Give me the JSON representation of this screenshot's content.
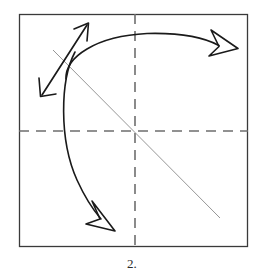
{
  "figure": {
    "kind": "origami-fold-step-diagram",
    "caption": "2.",
    "canvas": {
      "width": 264,
      "height": 279,
      "background": "#ffffff"
    },
    "colors": {
      "paper_border": "#3a3a3a",
      "crease_dashed": "#6e6e6e",
      "crease_thin": "#8a8a8a",
      "arrow_stroke": "#1a1a1a",
      "caption_text": "#2b2b2b"
    },
    "paper_square": {
      "label": "paper-outline",
      "x": 19,
      "y": 14,
      "width": 229,
      "height": 233,
      "stroke_width": 1.3
    },
    "creases": [
      {
        "name": "horizontal-crease",
        "style": "dashed",
        "x1": 19,
        "y1": 131,
        "x2": 248,
        "y2": 131,
        "dash": "10 7"
      },
      {
        "name": "vertical-crease",
        "style": "dashed",
        "x1": 135,
        "y1": 14,
        "x2": 135,
        "y2": 247,
        "dash": "10 7"
      },
      {
        "name": "diagonal-crease",
        "style": "thin-solid",
        "x1": 53,
        "y1": 50,
        "x2": 220,
        "y2": 218
      }
    ],
    "arrows": [
      {
        "name": "fold-over-arrow",
        "description": "Large curved arrow sweeping from the left crease intersection up over the top and to the right edge",
        "path": "M 66 77 C 66 56 96 36 146 34 C 183 33 205 39 218 45",
        "head": {
          "type": "open-barb",
          "x": 230,
          "y": 49,
          "angle": 28
        }
      },
      {
        "name": "fold-down-arrow",
        "description": "Curved arrow continuing from the intersection downward to the lower middle of the paper",
        "path": "M 74 54 C 60 82 60 140 78 180 C 88 201 96 211 102 218",
        "head": {
          "type": "open-barb",
          "x": 112,
          "y": 228,
          "angle": 50
        }
      },
      {
        "name": "perpendicular-double-arrow",
        "description": "Straight double-headed arrow crossing the arc, indicating the fold direction",
        "path": "M 44 92 L 85 28",
        "head_start": {
          "type": "barbed",
          "x": 40,
          "y": 98,
          "angle": 238
        },
        "head_end": {
          "type": "barbed",
          "x": 88,
          "y": 23,
          "angle": 58
        }
      }
    ]
  }
}
